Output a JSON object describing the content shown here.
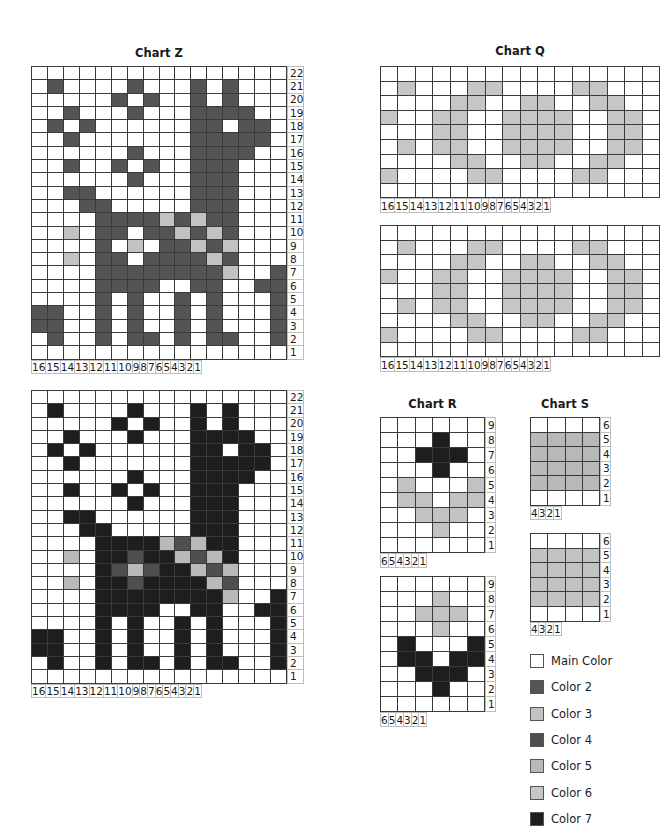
{
  "palette": {
    "W": "#ffffff",
    "2": "#545454",
    "3": "#c2c2c2",
    "4": "#4f4f4f",
    "5": "#b9b9b9",
    "6": "#c6c6c6",
    "7": "#1e1e1e"
  },
  "charts": {
    "z_top": {
      "title": "Chart Z",
      "cols": [
        "16",
        "15",
        "14",
        "13",
        "12",
        "11",
        "10",
        "9",
        "8",
        "7",
        "6",
        "5",
        "4",
        "3",
        "2",
        "1"
      ],
      "rows": [
        "22",
        "21",
        "20",
        "19",
        "18",
        "17",
        "16",
        "15",
        "14",
        "13",
        "12",
        "11",
        "10",
        "9",
        "8",
        "7",
        "6",
        "5",
        "4",
        "3",
        "2",
        "1"
      ],
      "cells": [
        "WWWWWWWWWWWWWWWW",
        "W2WWWW2WWW2W2WWW",
        "WWWWW2W2WW2W2WWW",
        "WW2WWW2WWW2222WW",
        "W2W2WWWWWW22W22W",
        "WW2WWWWWWW22222W",
        "WWWWWW2WWW2222WW",
        "WW2WW2W2WW222WWW",
        "WWWWWW2WWW222WWW",
        "WW22WWWWWW222WWW",
        "WWW22WWWWW222WWW",
        "WWWW222232322WWW",
        "WW3W22W223232WWW",
        "WWWW2W3W22323WWW",
        "WW3W22W222232WWW",
        "WWWW222222223WW2",
        "WWWW2222WW22WW22",
        "WWWW2W2WW2W2WWW2",
        "22WW2W2WW2W2WWW2",
        "22WW2W2WW2W2WWW2",
        "W2WW2W22W2W22WW2",
        "WWWWWWWWWWWWWWWW"
      ]
    },
    "z_bottom": {
      "cols": [
        "16",
        "15",
        "14",
        "13",
        "12",
        "11",
        "10",
        "9",
        "8",
        "7",
        "6",
        "5",
        "4",
        "3",
        "2",
        "1"
      ],
      "rows": [
        "22",
        "21",
        "20",
        "19",
        "18",
        "17",
        "16",
        "15",
        "14",
        "13",
        "12",
        "11",
        "10",
        "9",
        "8",
        "7",
        "6",
        "5",
        "4",
        "3",
        "2",
        "1"
      ],
      "cells": [
        "WWWWWWWWWWWWWWWW",
        "W7WWWW7WWW7W7WWW",
        "WWWWW7W7WW7W7WWW",
        "WW7WWW7WWW7777WW",
        "W7W7WWWWWW77W77W",
        "WW7WWWWWWW77777W",
        "WWWWWW7WWW7777WW",
        "WW7WW7W7WW777WWW",
        "WWWWWW7WWW777WWW",
        "WW77WWWWWW777WWW",
        "WWW77WWWWW777WWW",
        "WWWW777754577WWW",
        "WW5W774775457WWW",
        "WWWW745477545WWW",
        "WW5W774777754WWW",
        "WWWW777777775WW7",
        "WWWW7777WW77WW77",
        "WWWW7W7WW7W7WWW7",
        "77WW7W7WW7W7WWW7",
        "77WW7W7WW7W7WWW7",
        "W7WW7W77W7W77WW7",
        "WWWWWWWWWWWWWWWW"
      ]
    },
    "q_top": {
      "title": "Chart Q",
      "cols": [
        "16",
        "15",
        "14",
        "13",
        "12",
        "11",
        "10",
        "9",
        "8",
        "7",
        "6",
        "5",
        "4",
        "3",
        "2",
        "1"
      ],
      "rows": [
        "",
        "",
        "",
        "",
        "",
        "",
        "",
        "",
        ""
      ],
      "cells": [
        "WWWWWWWWWWWWWWWW",
        "W6WWW66WWWW66WWW",
        "WWWW66WW66WW66WW",
        "6WW66WW6666WW66W",
        "WWW66WW6666WW66W",
        "W6W66WW6666WW66W",
        "WWWW66WW66WW66WW",
        "6WWWW66WWWW66WWW",
        "WWWWWWWWWWWWWWWW"
      ]
    },
    "q_bottom": {
      "cols": [
        "16",
        "15",
        "14",
        "13",
        "12",
        "11",
        "10",
        "9",
        "8",
        "7",
        "6",
        "5",
        "4",
        "3",
        "2",
        "1"
      ],
      "rows": [
        "",
        "",
        "",
        "",
        "",
        "",
        "",
        "",
        ""
      ],
      "cells": [
        "WWWWWWWWWWWWWWWW",
        "W6WWW66WWWW66WWW",
        "WWWW66WW66WW66WW",
        "6WW66WW6666WW66W",
        "WWW66WW6666WW66W",
        "W6W66WW6666WW66W",
        "WWWW66WW66WW66WW",
        "6WWWW66WWWW66WWW",
        "WWWWWWWWWWWWWWWW"
      ]
    },
    "r_top": {
      "title": "Chart R",
      "cols": [
        "6",
        "5",
        "4",
        "3",
        "2",
        "1"
      ],
      "rows": [
        "9",
        "8",
        "7",
        "6",
        "5",
        "4",
        "3",
        "2",
        "1"
      ],
      "cells": [
        "WWWWWW",
        "WWW7WW",
        "WW777W",
        "WWW7WW",
        "W3WWW3",
        "W33W33",
        "WW333W",
        "WWW3WW",
        "WWWWWW"
      ]
    },
    "r_bottom": {
      "cols": [
        "6",
        "5",
        "4",
        "3",
        "2",
        "1"
      ],
      "rows": [
        "9",
        "8",
        "7",
        "6",
        "5",
        "4",
        "3",
        "2",
        "1"
      ],
      "cells": [
        "WWWWWW",
        "WWW3WW",
        "WW333W",
        "WWW3WW",
        "W7WWW7",
        "W77W77",
        "WW777W",
        "WWW7WW",
        "WWWWWW"
      ]
    },
    "s_top": {
      "title": "Chart S",
      "cols": [
        "4",
        "3",
        "2",
        "1"
      ],
      "rows": [
        "6",
        "5",
        "4",
        "3",
        "2",
        "1"
      ],
      "cells": [
        "WWWW",
        "5555",
        "5555",
        "5555",
        "5555",
        "WWWW"
      ]
    },
    "s_bottom": {
      "cols": [
        "4",
        "3",
        "2",
        "1"
      ],
      "rows": [
        "6",
        "5",
        "4",
        "3",
        "2",
        "1"
      ],
      "cells": [
        "WWWW",
        "3333",
        "3333",
        "3333",
        "3333",
        "WWWW"
      ]
    }
  },
  "legend": [
    {
      "key": "W",
      "label": "Main Color"
    },
    {
      "key": "2",
      "label": "Color 2"
    },
    {
      "key": "3",
      "label": "Color 3"
    },
    {
      "key": "4",
      "label": "Color 4"
    },
    {
      "key": "5",
      "label": "Color 5"
    },
    {
      "key": "6",
      "label": "Color 6"
    },
    {
      "key": "7",
      "label": "Color 7"
    }
  ]
}
